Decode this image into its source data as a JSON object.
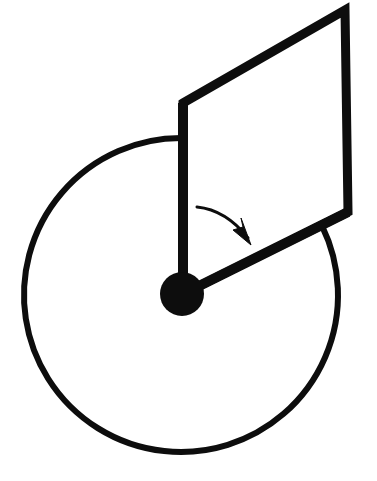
{
  "figure": {
    "type": "line-diagram",
    "canvas": {
      "width": 377,
      "height": 481,
      "background": "#ffffff"
    },
    "colors": {
      "ink": "#0d0d0d",
      "background": "#ffffff"
    },
    "stroke_widths": {
      "circle": 6,
      "rod": 10,
      "parallelogram": 9,
      "arrow": 3
    },
    "elements": {
      "circle": {
        "name": "disc-outline",
        "cx": 181,
        "cy": 295,
        "r": 157,
        "start_angle_deg": -90,
        "end_angle_deg": -26,
        "note": "open arc, gap between the vertical rod and the diagonal rod"
      },
      "pivot": {
        "name": "pivot-hub",
        "cx": 182,
        "cy": 294,
        "r": 22,
        "fill": "#0d0d0d"
      },
      "rod_vertical": {
        "name": "upper-rod",
        "x1": 183,
        "y1": 103,
        "x2": 183,
        "y2": 294
      },
      "rod_diagonal": {
        "name": "lower-rod",
        "x1": 183,
        "y1": 294,
        "x2": 348,
        "y2": 212
      },
      "parallelogram": {
        "name": "vane-panel",
        "points": "183,103 345,10 348,212 183,294"
      },
      "arrow": {
        "name": "rotation-arrow",
        "path": "M 197 207 Q 226 210 248 238",
        "tip_x": 250,
        "tip_y": 243,
        "head": "251,245 233,230 243,227 241,218",
        "direction": "clockwise"
      }
    }
  }
}
